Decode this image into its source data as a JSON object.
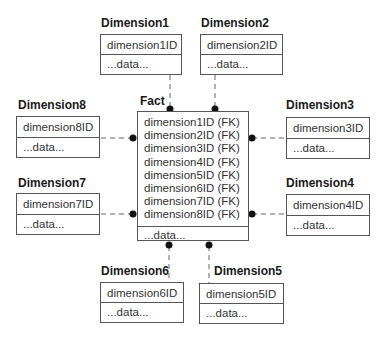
{
  "fact": {
    "title": "Fact",
    "keys": [
      "dimension1ID (FK)",
      "dimension2ID (FK)",
      "dimension3ID (FK)",
      "dimension4ID (FK)",
      "dimension5ID (FK)",
      "dimension6ID (FK)",
      "dimension7ID (FK)",
      "dimension8ID (FK)"
    ],
    "data": "...data..."
  },
  "dimensions": [
    {
      "title": "Dimension1",
      "key": "dimension1ID",
      "data": "...data..."
    },
    {
      "title": "Dimension2",
      "key": "dimension2ID",
      "data": "...data..."
    },
    {
      "title": "Dimension3",
      "key": "dimension3ID",
      "data": "...data..."
    },
    {
      "title": "Dimension4",
      "key": "dimension4ID",
      "data": "...data..."
    },
    {
      "title": "Dimension5",
      "key": "dimension5ID",
      "data": "...data..."
    },
    {
      "title": "Dimension6",
      "key": "dimension6ID",
      "data": "...data..."
    },
    {
      "title": "Dimension7",
      "key": "dimension7ID",
      "data": "...data..."
    },
    {
      "title": "Dimension8",
      "key": "dimension8ID",
      "data": "...data..."
    }
  ],
  "colors": {
    "line": "#555555",
    "dot": "#111111"
  }
}
